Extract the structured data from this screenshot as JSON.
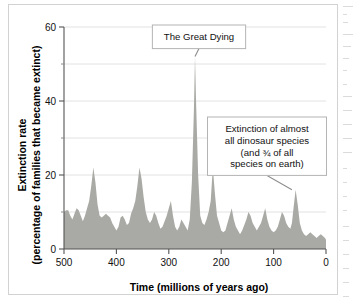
{
  "figure": {
    "background_color": "#ffffff",
    "border_color": "#d2d2d2",
    "area_fill_color": "#a9a9a5",
    "grid_color": "#e2e2e2",
    "axis_color": "#555555"
  },
  "axes": {
    "x_title": "Time  (millions of years ago)",
    "y_title_line1": "Extinction rate",
    "y_title_line2": "(percentage of families that became extinct)",
    "x_ticks": [
      "500",
      "400",
      "300",
      "200",
      "100",
      "0"
    ],
    "y_ticks": [
      "0",
      "20",
      "40",
      "60"
    ],
    "y_minor_ticks": [
      "10",
      "30",
      "50"
    ]
  },
  "annotations": [
    {
      "name": "great-dying",
      "lines": [
        "The Great Dying"
      ],
      "target_x_ma": 250,
      "target_value": 52
    },
    {
      "name": "kpg-extinction",
      "lines": [
        "Extinction of almost",
        "all dinosaur species",
        "(and ¾ of all",
        "species on earth)"
      ],
      "target_x_ma": 65,
      "target_value": 16
    }
  ],
  "chart_data": {
    "type": "area",
    "title": "",
    "xlabel": "Time  (millions of years ago)",
    "ylabel": "Extinction rate (percentage of families that became extinct)",
    "xlim": [
      500,
      0
    ],
    "ylim": [
      0,
      60
    ],
    "x_reversed": true,
    "grid": true,
    "legend": "none",
    "x_unit": "millions of years ago",
    "y_unit": "percent",
    "x": [
      500,
      496,
      492,
      488,
      484,
      480,
      476,
      472,
      468,
      464,
      460,
      456,
      452,
      448,
      444,
      440,
      436,
      432,
      428,
      424,
      420,
      416,
      412,
      408,
      404,
      400,
      396,
      392,
      388,
      384,
      380,
      376,
      372,
      368,
      364,
      360,
      356,
      352,
      348,
      344,
      340,
      336,
      332,
      328,
      324,
      320,
      316,
      312,
      308,
      304,
      300,
      296,
      292,
      288,
      284,
      280,
      276,
      272,
      268,
      264,
      260,
      256,
      252,
      250,
      248,
      244,
      240,
      236,
      232,
      228,
      224,
      220,
      216,
      212,
      208,
      204,
      200,
      196,
      192,
      188,
      184,
      180,
      176,
      172,
      168,
      164,
      160,
      156,
      152,
      148,
      144,
      140,
      136,
      132,
      128,
      124,
      120,
      116,
      112,
      108,
      104,
      100,
      96,
      92,
      88,
      84,
      80,
      76,
      72,
      68,
      65,
      62,
      58,
      54,
      50,
      46,
      42,
      38,
      34,
      30,
      26,
      22,
      18,
      14,
      10,
      6,
      2,
      0
    ],
    "y": [
      10,
      10.5,
      10.5,
      9,
      8,
      9.5,
      11,
      10.5,
      9,
      7.5,
      9,
      11,
      13,
      17,
      22,
      18,
      12,
      9,
      8.5,
      9,
      9.5,
      9,
      8.5,
      7,
      6,
      5,
      6,
      8.5,
      9,
      8,
      6.5,
      7,
      9.5,
      11,
      13,
      17,
      22,
      19,
      14,
      10,
      8,
      7,
      8,
      10,
      9,
      7,
      5.5,
      6,
      7.5,
      9,
      11,
      13,
      9,
      6,
      5,
      6,
      8,
      7,
      6,
      5,
      8,
      18,
      38,
      52,
      40,
      20,
      9,
      7,
      6.5,
      8,
      10,
      13,
      22,
      15,
      9,
      7,
      5,
      4.5,
      5,
      7,
      9,
      11,
      8,
      6,
      5,
      4,
      5,
      6.5,
      8,
      10,
      9,
      7,
      6,
      5,
      6,
      7,
      9,
      11,
      8,
      6,
      5,
      4.5,
      5,
      6,
      8,
      10,
      9,
      7,
      6,
      5.5,
      7,
      11,
      16,
      12,
      7,
      5,
      4,
      3.5,
      4,
      4.5,
      4,
      3.5,
      3,
      3.5,
      4,
      3.5,
      3,
      2.5,
      2,
      1.5
    ]
  }
}
